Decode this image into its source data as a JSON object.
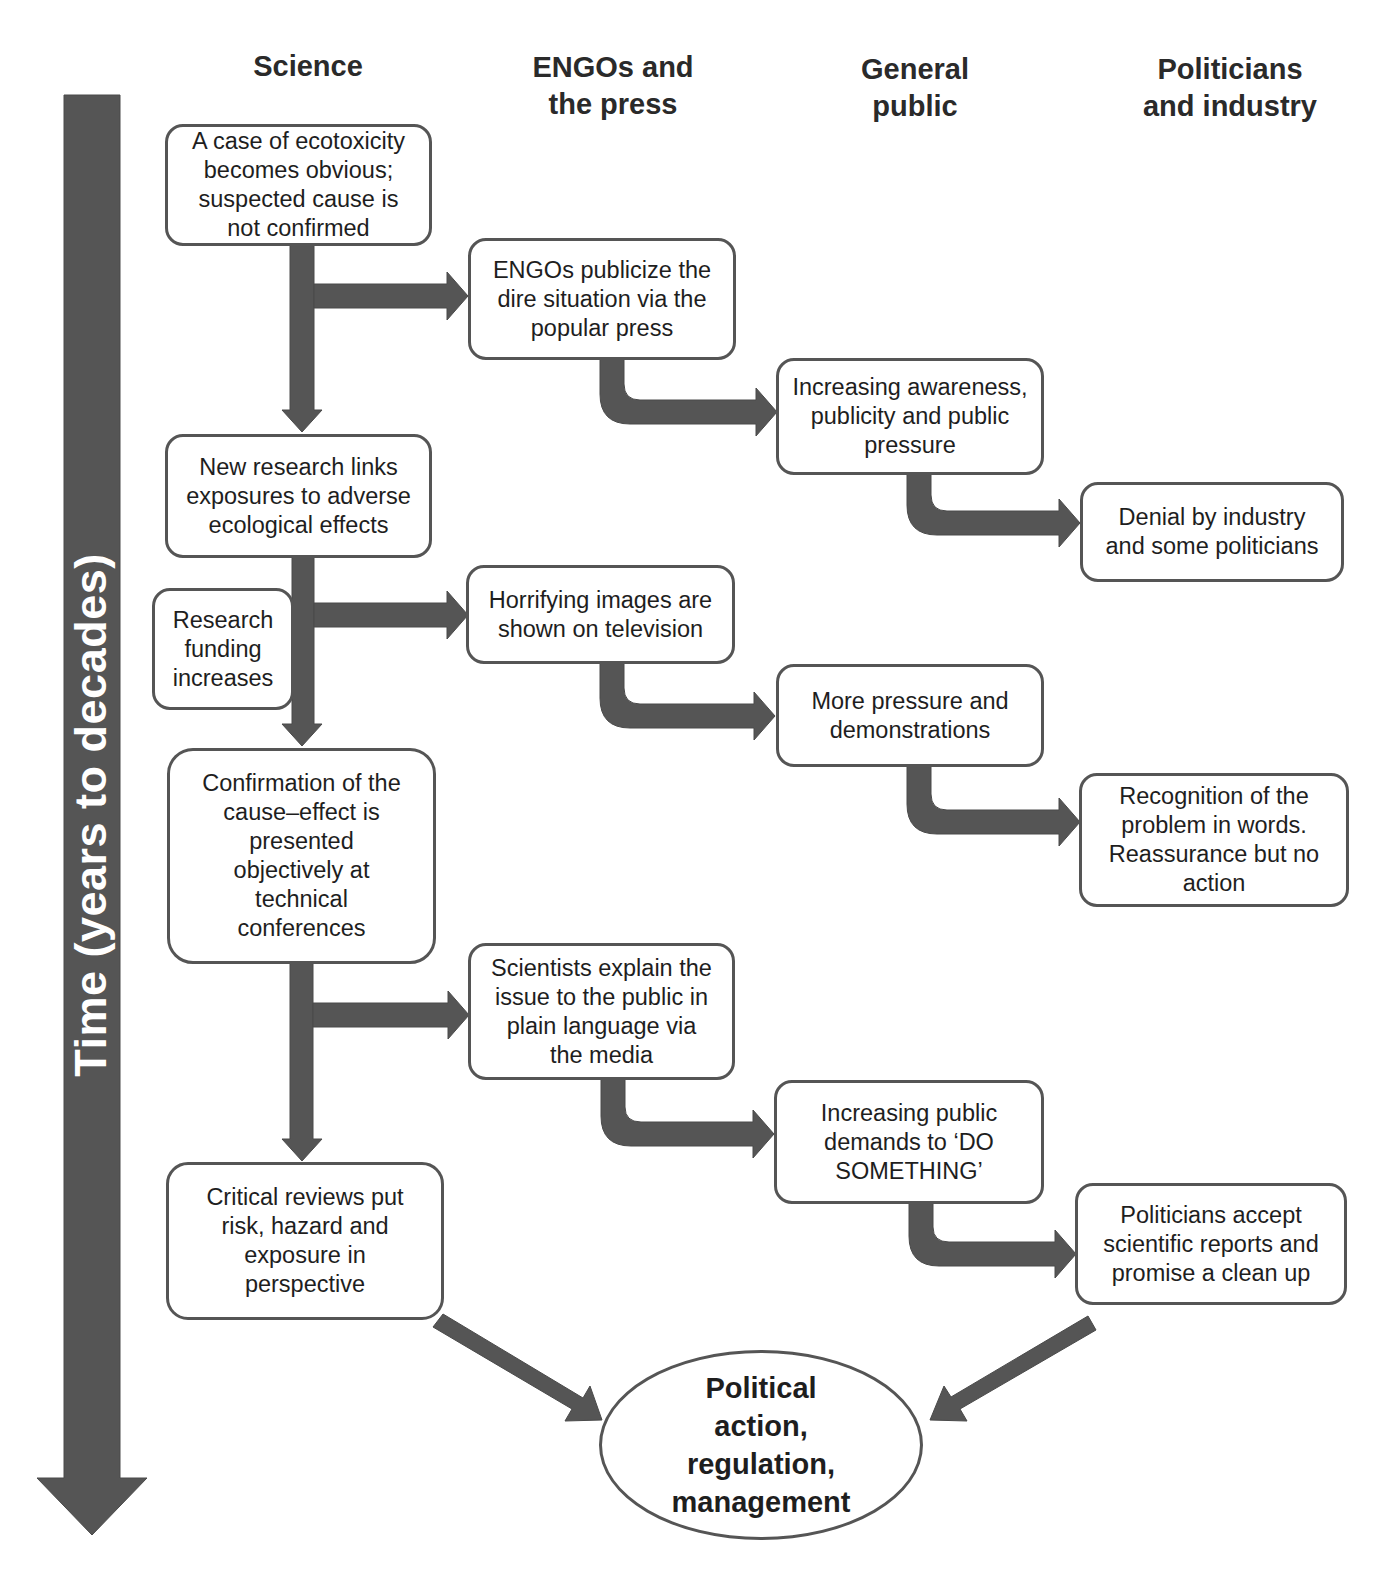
{
  "diagram": {
    "time_axis": {
      "label": "Time (years to decades)",
      "color": "#555555",
      "direction": "down"
    },
    "columns": [
      {
        "id": "science",
        "label": "Science"
      },
      {
        "id": "engos_press",
        "label": "ENGOs and\nthe press"
      },
      {
        "id": "general_public",
        "label": "General\npublic"
      },
      {
        "id": "politicians_industry",
        "label": "Politicians\nand industry"
      }
    ],
    "nodes": {
      "s1": {
        "column": "science",
        "text": "A case of ecotoxicity\nbecomes obvious;\nsuspected cause is\nnot confirmed"
      },
      "s2": {
        "column": "science",
        "text": "New research links\nexposures to adverse\necological effects"
      },
      "s_funding": {
        "column": "science",
        "text": "Research\nfunding\nincreases"
      },
      "s3": {
        "column": "science",
        "text": "Confirmation of the\ncause–effect is\npresented\nobjectively at\ntechnical\nconferences"
      },
      "s4": {
        "column": "science",
        "text": "Critical reviews put\nrisk, hazard and\nexposure in\nperspective"
      },
      "e1": {
        "column": "engos_press",
        "text": "ENGOs publicize the\ndire situation via the\npopular press"
      },
      "e2": {
        "column": "engos_press",
        "text": "Horrifying images are\nshown on television"
      },
      "e3": {
        "column": "engos_press",
        "text": "Scientists explain the\nissue to the public in\nplain language via\nthe media"
      },
      "g1": {
        "column": "general_public",
        "text": "Increasing awareness,\npublicity and public\npressure"
      },
      "g2": {
        "column": "general_public",
        "text": "More pressure and\ndemonstrations"
      },
      "g3": {
        "column": "general_public",
        "text": "Increasing public\ndemands to ‘DO\nSOMETHING’"
      },
      "p1": {
        "column": "politicians_industry",
        "text": "Denial by industry\nand some politicians"
      },
      "p2": {
        "column": "politicians_industry",
        "text": "Recognition of the\nproblem in words.\nReassurance but no\naction"
      },
      "p3": {
        "column": "politicians_industry",
        "text": "Politicians accept\nscientific reports and\npromise a clean up"
      },
      "outcome": {
        "shape": "ellipse",
        "text": "Political\naction,\nregulation,\nmanagement"
      }
    },
    "edges": [
      {
        "from": "s1",
        "to": "s2",
        "type": "straight"
      },
      {
        "from": "s1",
        "to": "e1",
        "type": "branch"
      },
      {
        "from": "e1",
        "to": "g1",
        "type": "elbow"
      },
      {
        "from": "g1",
        "to": "p1",
        "type": "elbow"
      },
      {
        "from": "s2",
        "to": "s3",
        "type": "straight"
      },
      {
        "from": "s2",
        "to": "e2",
        "type": "branch"
      },
      {
        "from": "e2",
        "to": "g2",
        "type": "elbow"
      },
      {
        "from": "g2",
        "to": "p2",
        "type": "elbow"
      },
      {
        "from": "s3",
        "to": "s4",
        "type": "straight"
      },
      {
        "from": "s3",
        "to": "e3",
        "type": "branch"
      },
      {
        "from": "e3",
        "to": "g3",
        "type": "elbow"
      },
      {
        "from": "g3",
        "to": "p3",
        "type": "elbow"
      },
      {
        "from": "s4",
        "to": "outcome",
        "type": "diagonal"
      },
      {
        "from": "p3",
        "to": "outcome",
        "type": "diagonal"
      }
    ],
    "colors": {
      "arrow_fill": "#555555",
      "box_border": "#555555",
      "text": "#1e1e1e",
      "background": "#ffffff"
    }
  }
}
